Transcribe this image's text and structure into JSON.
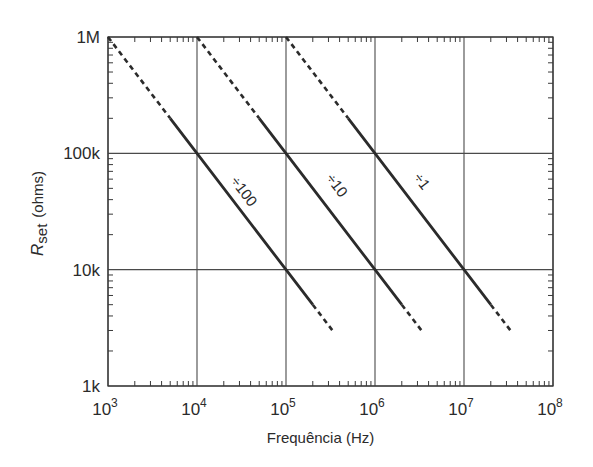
{
  "chart_data": {
    "type": "line",
    "title": "",
    "xlabel": "Frequência (Hz)",
    "ylabel": "Rset (ohms)",
    "ylabel_parts": {
      "main": "R",
      "sub": "set",
      "unit": "(ohms)"
    },
    "xscale": "log",
    "yscale": "log",
    "xlim": [
      1000,
      100000000
    ],
    "ylim": [
      1000,
      1000000
    ],
    "grid": true,
    "legend": "none (inline labels)",
    "x_ticks": [
      {
        "value": 1000,
        "base": "10",
        "exp": "3"
      },
      {
        "value": 10000,
        "base": "10",
        "exp": "4"
      },
      {
        "value": 100000,
        "base": "10",
        "exp": "5"
      },
      {
        "value": 1000000,
        "base": "10",
        "exp": "6"
      },
      {
        "value": 10000000,
        "base": "10",
        "exp": "7"
      },
      {
        "value": 100000000,
        "base": "10",
        "exp": "8"
      }
    ],
    "y_ticks": [
      {
        "value": 1000000,
        "label": "1M"
      },
      {
        "value": 100000,
        "label": "100k"
      },
      {
        "value": 10000,
        "label": "10k"
      },
      {
        "value": 1000,
        "label": "1k"
      }
    ],
    "series": [
      {
        "name": "÷100",
        "formula": "R = 1e9 / f",
        "dashed_upper": {
          "x": [
            1000,
            5000
          ],
          "y": [
            1000000,
            200000
          ]
        },
        "solid": {
          "x": [
            5000,
            10000,
            100000,
            200000
          ],
          "y": [
            200000,
            100000,
            10000,
            5000
          ]
        },
        "dashed_lower": {
          "x": [
            200000,
            333000
          ],
          "y": [
            5000,
            3000
          ]
        }
      },
      {
        "name": "÷10",
        "formula": "R = 1e10 / f",
        "dashed_upper": {
          "x": [
            10000,
            50000
          ],
          "y": [
            1000000,
            200000
          ]
        },
        "solid": {
          "x": [
            50000,
            100000,
            1000000,
            2000000
          ],
          "y": [
            200000,
            100000,
            10000,
            5000
          ]
        },
        "dashed_lower": {
          "x": [
            2000000,
            3330000
          ],
          "y": [
            5000,
            3000
          ]
        }
      },
      {
        "name": "÷1",
        "formula": "R = 1e11 / f",
        "dashed_upper": {
          "x": [
            100000,
            500000
          ],
          "y": [
            1000000,
            200000
          ]
        },
        "solid": {
          "x": [
            500000,
            1000000,
            10000000,
            20000000
          ],
          "y": [
            200000,
            100000,
            10000,
            5000
          ]
        },
        "dashed_lower": {
          "x": [
            20000000,
            33300000
          ],
          "y": [
            5000,
            3000
          ]
        }
      }
    ],
    "colors": {
      "line": "#2b2b2b",
      "grid": "#4a4a4a",
      "frame": "#3a3a3a"
    }
  }
}
